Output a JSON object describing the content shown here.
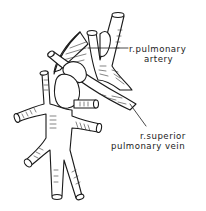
{
  "figure": {
    "type": "anatomical line illustration",
    "colors": {
      "ink": "#1a1a1a",
      "background": "#ffffff"
    }
  },
  "labels": {
    "pulmonary_artery": {
      "line1": "r.pulmonary",
      "line2": "artery"
    },
    "superior_vein": {
      "line1": "r.superior",
      "line2": "pulmonary vein"
    }
  }
}
